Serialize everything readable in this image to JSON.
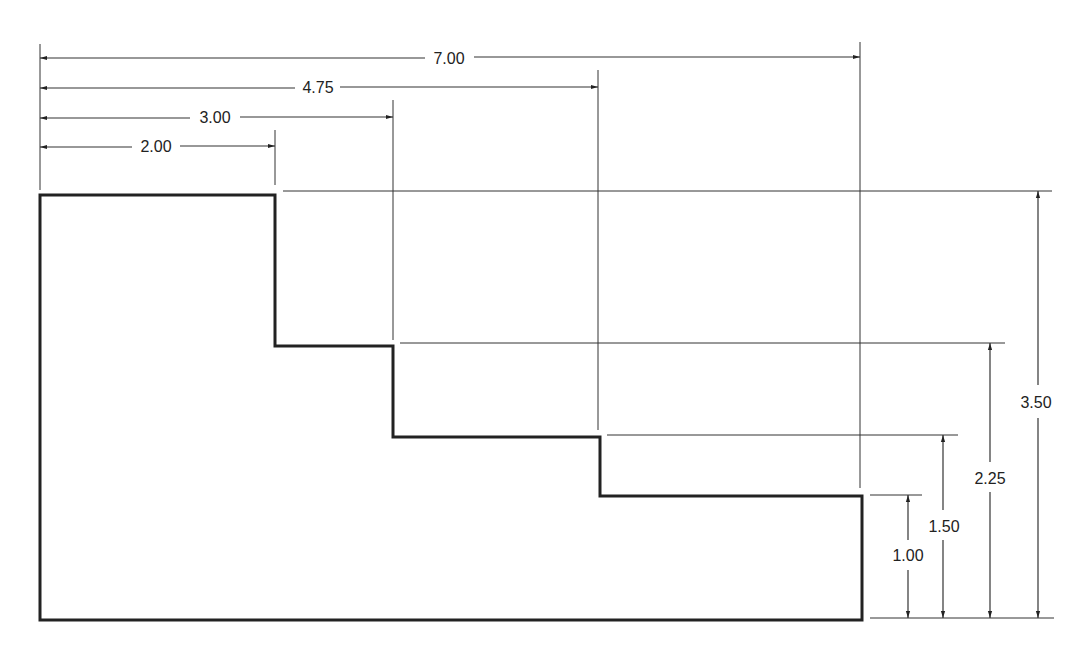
{
  "drawing": {
    "type": "stepped-profile-dimensioned",
    "horizontal_dimensions": [
      {
        "label": "7.00",
        "value": 7.0
      },
      {
        "label": "4.75",
        "value": 4.75
      },
      {
        "label": "3.00",
        "value": 3.0
      },
      {
        "label": "2.00",
        "value": 2.0
      }
    ],
    "vertical_dimensions": [
      {
        "label": "3.50",
        "value": 3.5
      },
      {
        "label": "2.25",
        "value": 2.25
      },
      {
        "label": "1.50",
        "value": 1.5
      },
      {
        "label": "1.00",
        "value": 1.0
      }
    ],
    "colors": {
      "line": "#222222",
      "background": "#ffffff"
    }
  }
}
